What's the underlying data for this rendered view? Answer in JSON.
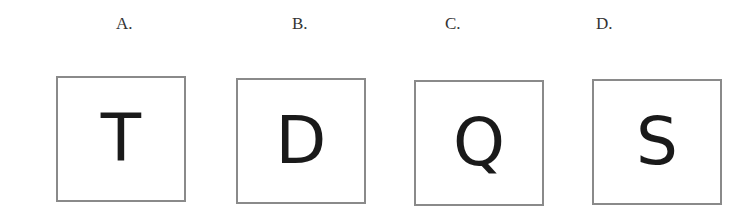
{
  "options": [
    {
      "label": "A.",
      "letter": "T"
    },
    {
      "label": "B.",
      "letter": "D"
    },
    {
      "label": "C.",
      "letter": "Q"
    },
    {
      "label": "D.",
      "letter": "S"
    }
  ],
  "colors": {
    "border": "#8a8a8a",
    "text": "#1a1a1a",
    "label": "#333333"
  }
}
